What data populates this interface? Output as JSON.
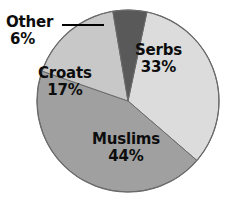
{
  "chart_data": {
    "type": "pie",
    "title": "",
    "subtitle": "",
    "xlabel": "",
    "ylabel": "",
    "legend_position": "none",
    "grid": false,
    "units": "percent",
    "categories": [
      "Serbs",
      "Muslims",
      "Croats",
      "Other"
    ],
    "values": [
      33,
      44,
      17,
      6
    ],
    "slices": [
      {
        "name": "Serbs",
        "value": 33,
        "value_label": "33%",
        "color": "#dcdcdc",
        "label_placement": "inside",
        "start_angle_deg": 12,
        "end_angle_deg": 131
      },
      {
        "name": "Muslims",
        "value": 44,
        "value_label": "44%",
        "color": "#a0a0a0",
        "label_placement": "inside",
        "start_angle_deg": 131,
        "end_angle_deg": 289
      },
      {
        "name": "Croats",
        "value": 17,
        "value_label": "17%",
        "color": "#c8c8c8",
        "label_placement": "inside",
        "start_angle_deg": 289,
        "end_angle_deg": 350
      },
      {
        "name": "Other",
        "value": 6,
        "value_label": "6%",
        "color": "#595959",
        "label_placement": "outside-leader",
        "start_angle_deg": 350,
        "end_angle_deg": 12
      }
    ],
    "total": 100
  },
  "chart": {
    "geometry": {
      "center_x": 128,
      "center_y": 101,
      "radius": 91
    },
    "outline_color": "#4a4a4a",
    "background": "#ffffff",
    "text_color": "#0d0d0d",
    "leader_line": {
      "from_x": 62,
      "from_y": 25,
      "to_x": 104,
      "to_y": 25,
      "color": "#000000"
    }
  }
}
